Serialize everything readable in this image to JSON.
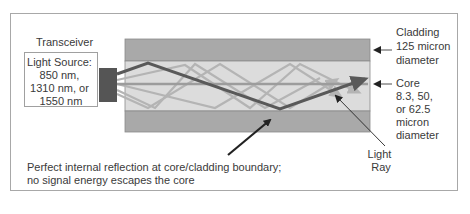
{
  "transceiver": {
    "title": "Transceiver",
    "source_lines": [
      "Light Source:",
      "850 nm,",
      "1310 nm, or",
      "1550 nm"
    ]
  },
  "cladding": {
    "lines": [
      "Cladding",
      "125 micron",
      "diameter"
    ]
  },
  "core": {
    "lines": [
      "Core",
      "8.3, 50,",
      "or 62.5",
      "micron",
      "diameter"
    ]
  },
  "light_ray": {
    "lines": [
      "Light",
      "Ray"
    ]
  },
  "reflection_note": {
    "lines": [
      "Perfect internal reflection at core/cladding boundary;",
      "no signal energy escapes the core"
    ]
  },
  "colors": {
    "frame": "#a8a8a8",
    "cladding": "#a9a9a9",
    "core": "#dcdcdc",
    "emitter": "#555555",
    "main_ray": "#595959",
    "secondary_rays": "#b4b4b4"
  }
}
